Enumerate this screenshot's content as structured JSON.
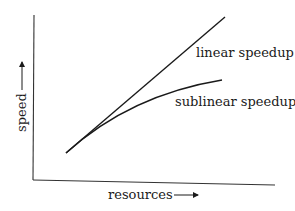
{
  "diagram": {
    "axes": {
      "x_label": "resources",
      "y_label": "speed"
    },
    "curves": [
      {
        "name": "linear",
        "label": "linear speedup"
      },
      {
        "name": "sublinear",
        "label": "sublinear speedup"
      }
    ],
    "colors": {
      "line": "#1a1a1a",
      "background": "#ffffff"
    }
  }
}
